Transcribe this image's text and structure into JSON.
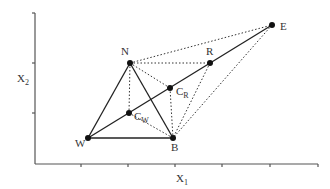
{
  "diagram": {
    "axes": {
      "x_label": "X",
      "x_label_sub": "1",
      "y_label": "X",
      "y_label_sub": "2",
      "color": "#555555"
    },
    "points": {
      "N": {
        "label": "N",
        "x": 130,
        "y": 63
      },
      "R": {
        "label": "R",
        "x": 210,
        "y": 63
      },
      "E": {
        "label": "E",
        "x": 272,
        "y": 25
      },
      "CR": {
        "label": "C",
        "sub": "R",
        "x": 170,
        "y": 88
      },
      "CW": {
        "label": "C",
        "sub": "W",
        "x": 129,
        "y": 113
      },
      "W": {
        "label": "W",
        "x": 88,
        "y": 138
      },
      "B": {
        "label": "B",
        "x": 173,
        "y": 138
      }
    },
    "solid_segments": [
      [
        "W",
        "N"
      ],
      [
        "N",
        "B"
      ],
      [
        "W",
        "B"
      ],
      [
        "W",
        "E"
      ]
    ],
    "dotted_segments": [
      [
        "N",
        "E"
      ],
      [
        "N",
        "R"
      ],
      [
        "N",
        "CR"
      ],
      [
        "N",
        "CW"
      ],
      [
        "CW",
        "B"
      ],
      [
        "CR",
        "B"
      ],
      [
        "R",
        "B"
      ],
      [
        "E",
        "B"
      ]
    ],
    "line_color": "#222222",
    "point_color": "#111111"
  }
}
